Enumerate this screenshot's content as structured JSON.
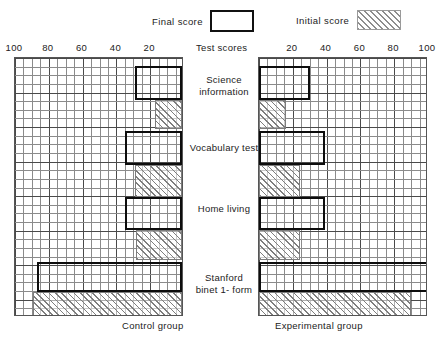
{
  "legend": {
    "final_label": "Final score",
    "initial_label": "Initial score"
  },
  "center_axis_caption": "Test scores",
  "groups": {
    "left_caption": "Control group",
    "right_caption": "Experimental group"
  },
  "left_axis_ticks": [
    "100",
    "80",
    "60",
    "40",
    "20"
  ],
  "right_axis_ticks": [
    "20",
    "40",
    "60",
    "80",
    "100"
  ],
  "categories": [
    {
      "line1": "Science",
      "line2": "information"
    },
    {
      "line1": "Vocabulary test",
      "line2": ""
    },
    {
      "line1": "Home living",
      "line2": ""
    },
    {
      "line1": "Stanford",
      "line2": "binet 1- form"
    }
  ],
  "colors": {
    "final_outline": "#0d0d0d",
    "initial_hatch": "#7e7e7e",
    "grid_minor": "#8b8b8b",
    "grid_major": "#4a4a4a",
    "text": "#222222",
    "background": "#ffffff"
  },
  "chart_data": {
    "type": "bar",
    "title": "",
    "subtitle": "",
    "orientation": "horizontal",
    "xlabel": "Test scores",
    "ylabel": "",
    "grid": true,
    "legend": {
      "position": "top",
      "entries": [
        "Final score",
        "Initial score"
      ]
    },
    "panels": [
      {
        "name": "Control group",
        "axis_direction": "right-to-left",
        "xlim": [
          0,
          100
        ],
        "xticks": [
          100,
          80,
          60,
          40,
          20
        ],
        "categories": [
          "Science information",
          "Vocabulary test",
          "Home living",
          "Stanford binet 1-form"
        ],
        "series": [
          {
            "name": "Final score",
            "values": [
              28,
              34,
              34,
              86
            ]
          },
          {
            "name": "Initial score",
            "values": [
              16,
              28,
              27,
              88
            ]
          }
        ]
      },
      {
        "name": "Experimental group",
        "axis_direction": "left-to-right",
        "xlim": [
          0,
          100
        ],
        "xticks": [
          20,
          40,
          60,
          80,
          100
        ],
        "categories": [
          "Science information",
          "Vocabulary test",
          "Home living",
          "Stanford binet 1-form"
        ],
        "series": [
          {
            "name": "Final score",
            "values": [
              30,
              39,
              39,
              100
            ]
          },
          {
            "name": "Initial score",
            "values": [
              16,
              24,
              24,
              90
            ]
          }
        ]
      }
    ]
  }
}
